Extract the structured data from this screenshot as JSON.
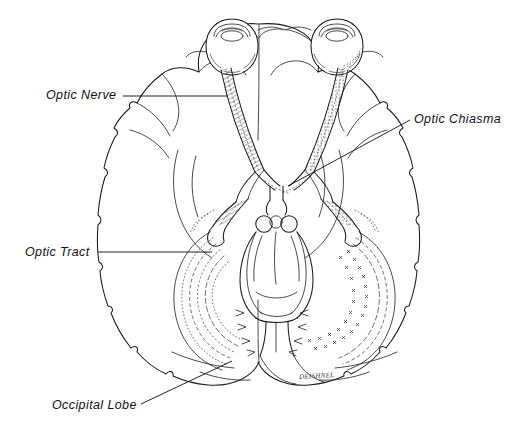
{
  "figure": {
    "background_color": "#ffffff",
    "ink_color": "#1a1a1a",
    "signature": "DEISHNEL"
  },
  "labels": [
    {
      "id": "optic-nerve",
      "text": "Optic Nerve",
      "leader": "horizontal-right"
    },
    {
      "id": "optic-chiasma",
      "text": "Optic Chiasma",
      "leader": "diagonal-down-left"
    },
    {
      "id": "optic-tract",
      "text": "Optic Tract",
      "leader": "horizontal-right"
    },
    {
      "id": "occipital-lobe",
      "text": "Occipital Lobe",
      "leader": "diagonal-up-right"
    }
  ],
  "structures": [
    {
      "name": "left-eyeball",
      "kind": "outline"
    },
    {
      "name": "right-eyeball",
      "kind": "outline"
    },
    {
      "name": "left-optic-nerve",
      "kind": "hatched-band"
    },
    {
      "name": "right-optic-nerve",
      "kind": "dotted-band"
    },
    {
      "name": "optic-chiasma",
      "kind": "x-crossing"
    },
    {
      "name": "left-optic-tract",
      "kind": "hatched-band"
    },
    {
      "name": "right-optic-tract",
      "kind": "dotted-band"
    },
    {
      "name": "lateral-geniculate",
      "kind": "outline"
    },
    {
      "name": "optic-radiations-left",
      "kind": "dashed-arcs"
    },
    {
      "name": "optic-radiations-right",
      "kind": "cross-marked-arcs"
    },
    {
      "name": "brainstem-midbrain",
      "kind": "outline"
    },
    {
      "name": "mammillary-bodies",
      "kind": "outline"
    },
    {
      "name": "cerebral-hemispheres",
      "kind": "gyri-outline"
    },
    {
      "name": "occipital-lobes",
      "kind": "gyri-outline"
    },
    {
      "name": "frontal-lobes",
      "kind": "gyri-outline"
    }
  ]
}
